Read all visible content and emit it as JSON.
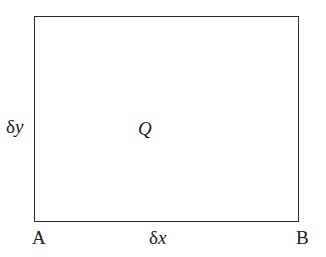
{
  "diagram": {
    "type": "rectangular element",
    "labels": {
      "corner_left": "A",
      "corner_right": "B",
      "width_symbol": "δ",
      "width_var": "x",
      "height_symbol": "δ",
      "height_var": "y",
      "center": "Q"
    },
    "colors": {
      "stroke": "#2a2a2a",
      "text": "#1a1a1a",
      "background": "#ffffff"
    }
  }
}
